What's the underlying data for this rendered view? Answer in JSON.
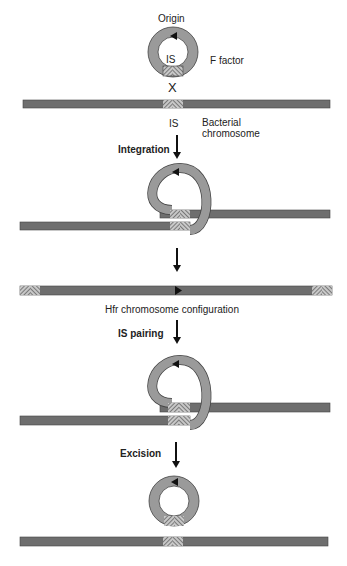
{
  "labels": {
    "origin": "Origin",
    "f_factor": "F factor",
    "is_top": "IS",
    "is_bottom": "IS",
    "bacterial": "Bacterial",
    "chromosome": "chromosome",
    "integration": "Integration",
    "hfr": "Hfr chromosome configuration",
    "is_pairing": "IS pairing",
    "excision": "Excision",
    "cross": "X"
  },
  "colors": {
    "chromosome": "#6e6e6e",
    "plasmid": "#9a9a9a",
    "outline": "#333333",
    "hatch": "#555555"
  }
}
